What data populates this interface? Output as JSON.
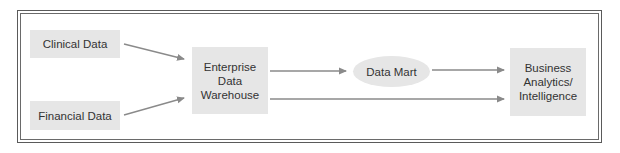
{
  "diagram": {
    "type": "flowchart",
    "colors": {
      "node_fill": "#e6e6e6",
      "node_text": "#333333",
      "arrow": "#8a8a8a",
      "frame": "#5a5a5a"
    },
    "nodes": [
      {
        "id": "clinical",
        "label": "Clinical Data",
        "shape": "rect"
      },
      {
        "id": "financial",
        "label": "Financial Data",
        "shape": "rect"
      },
      {
        "id": "edw",
        "label": "Enterprise\nData\nWarehouse",
        "shape": "rect"
      },
      {
        "id": "datamart",
        "label": "Data Mart",
        "shape": "ellipse"
      },
      {
        "id": "ba",
        "label": "Business\nAnalytics/\nIntelligence",
        "shape": "rect"
      }
    ],
    "edges": [
      {
        "from": "clinical",
        "to": "edw"
      },
      {
        "from": "financial",
        "to": "edw"
      },
      {
        "from": "edw",
        "to": "datamart"
      },
      {
        "from": "datamart",
        "to": "ba"
      },
      {
        "from": "edw",
        "to": "ba"
      }
    ]
  }
}
